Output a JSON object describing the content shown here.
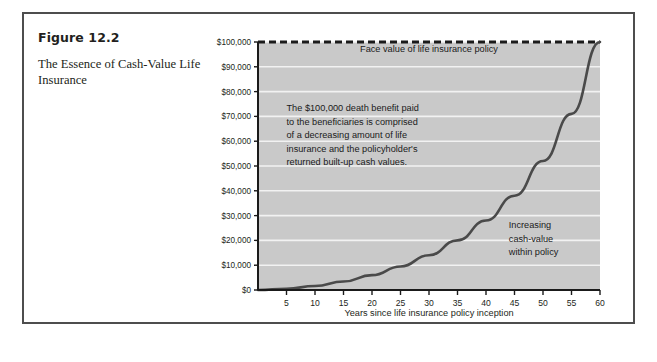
{
  "figure": {
    "number": "Figure 12.2",
    "title": "The Essence of Cash-Value Life Insurance"
  },
  "colors": {
    "frame_border": "#4d4d4d",
    "plot_background": "#c9c9c9",
    "gridline": "#f2f2f2",
    "axis": "#1a1a1a",
    "curve": "#4a4a4a",
    "text": "#231f20"
  },
  "chart_data": {
    "type": "line",
    "title": "",
    "xlabel": "Years since life insurance policy inception",
    "ylabel": "",
    "xlim": [
      0,
      60
    ],
    "ylim": [
      0,
      100000
    ],
    "grid": true,
    "legend": "none",
    "xticks": [
      5,
      10,
      15,
      20,
      25,
      30,
      35,
      40,
      45,
      50,
      55,
      60
    ],
    "xtick_labels": [
      "5",
      "10",
      "15",
      "20",
      "25",
      "30",
      "35",
      "40",
      "45",
      "50",
      "55",
      "60"
    ],
    "yticks": [
      0,
      10000,
      20000,
      30000,
      40000,
      50000,
      60000,
      70000,
      80000,
      90000,
      100000
    ],
    "ytick_labels": [
      "$0",
      "$10,000",
      "$20,000",
      "$30,000",
      "$40,000",
      "$50,000",
      "$60,000",
      "$70,000",
      "$80,000",
      "$90,000",
      "$100,000"
    ],
    "series": [
      {
        "name": "Cash value within policy",
        "style": "solid",
        "x": [
          0,
          5,
          10,
          15,
          20,
          25,
          30,
          35,
          40,
          45,
          50,
          55,
          60
        ],
        "values": [
          0,
          500,
          1600,
          3400,
          6000,
          9500,
          14000,
          20000,
          28000,
          38000,
          52000,
          71000,
          100000
        ]
      },
      {
        "name": "Face value of life insurance policy",
        "style": "dashed",
        "x": [
          0,
          60
        ],
        "values": [
          100000,
          100000
        ]
      }
    ],
    "annotations": [
      {
        "name": "face-value-label",
        "text": "Face value of life insurance policy",
        "x": 30,
        "y": 96000
      },
      {
        "name": "death-benefit-note",
        "lines": [
          "The $100,000 death benefit paid",
          "to the beneficiaries is comprised",
          "of a decreasing amount of  life",
          "insurance and the policyholder's",
          "returned built-up cash values."
        ],
        "x": 5,
        "y": 72000
      },
      {
        "name": "cash-value-note",
        "lines": [
          "Increasing",
          "cash-value",
          "within policy"
        ],
        "x": 44,
        "y": 25000
      }
    ]
  }
}
